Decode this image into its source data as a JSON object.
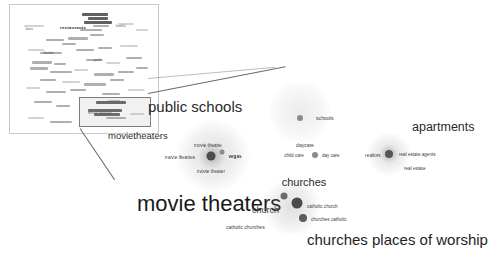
{
  "view": {
    "title": "semantic cluster map",
    "background": "#ffffff",
    "dot_color": "#8a8a8a",
    "text_color": "#3d3d3d"
  },
  "inset": {
    "name": "overview-map",
    "border_color": "#c9c9c9",
    "visible_words": [
      {
        "text": "restaurants",
        "x": 62,
        "y": 22,
        "size": "big"
      },
      {
        "text": "bars",
        "x": 24,
        "y": 24,
        "size": "small"
      },
      {
        "text": "hotels",
        "x": 112,
        "y": 21,
        "size": "small"
      },
      {
        "text": "banks",
        "x": 40,
        "y": 48,
        "size": "small"
      },
      {
        "text": "parks",
        "x": 90,
        "y": 55,
        "size": "small"
      },
      {
        "text": "schools",
        "x": 104,
        "y": 96,
        "size": "small"
      },
      {
        "text": "movie theaters",
        "x": 88,
        "y": 108,
        "size": "small"
      }
    ],
    "selection": {
      "name": "detail-selection-rect",
      "x": 69,
      "y": 92,
      "width": 70,
      "height": 28
    }
  },
  "clusters": [
    {
      "name": "public-schools",
      "heading": "public schools",
      "terms": [
        {
          "text": "schools",
          "x": 307,
          "y": 118
        }
      ]
    },
    {
      "name": "movie-theaters",
      "heading": "movie theaters",
      "subheading": "movietheaters",
      "terms": [
        {
          "text": "movie theatre",
          "x": 208,
          "y": 145
        },
        {
          "text": "movie theatres",
          "x": 180,
          "y": 157
        },
        {
          "text": "vegas",
          "x": 235,
          "y": 156
        },
        {
          "text": "movie theater",
          "x": 211,
          "y": 171
        }
      ]
    },
    {
      "name": "daycare",
      "heading": "daycare",
      "terms": [
        {
          "text": "child care",
          "x": 291,
          "y": 155
        },
        {
          "text": "day care",
          "x": 324,
          "y": 155
        }
      ]
    },
    {
      "name": "apartments",
      "heading": "apartments",
      "terms": [
        {
          "text": "realtors",
          "x": 357,
          "y": 155
        },
        {
          "text": "real estate agents",
          "x": 408,
          "y": 154
        },
        {
          "text": "real estate",
          "x": 419,
          "y": 168
        }
      ]
    },
    {
      "name": "churches",
      "heading": "churches",
      "subheading": "churches places of worship",
      "terms": [
        {
          "text": "church",
          "x": 268,
          "y": 209
        },
        {
          "text": "catholic church",
          "x": 318,
          "y": 207
        },
        {
          "text": "catholic churches",
          "x": 252,
          "y": 226
        },
        {
          "text": "churches catholic",
          "x": 322,
          "y": 219
        }
      ]
    }
  ],
  "headings": {
    "public_schools": "public schools",
    "movietheaters": "movietheaters",
    "movie_theaters": "movie theaters",
    "daycare": "daycare",
    "churches": "churches",
    "apartments": "apartments",
    "churches_places_of_worship": "churches places of worship"
  }
}
